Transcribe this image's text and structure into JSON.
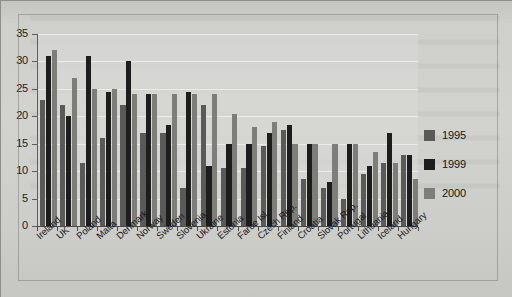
{
  "chart_data": {
    "type": "bar",
    "title": "",
    "xlabel": "",
    "ylabel": "",
    "ylim": [
      0,
      35
    ],
    "ytick_step": 5,
    "yticks": [
      0,
      5,
      10,
      15,
      20,
      25,
      30,
      35
    ],
    "grid": true,
    "legend_position": "right",
    "categories": [
      "Ireland",
      "UK",
      "Poland",
      "Malta",
      "Denmark",
      "Norway",
      "Sweden",
      "Slovenia",
      "Ukraine",
      "Estonia",
      "Faroe Isl.",
      "Czech Rep.",
      "Finland",
      "Croatia",
      "Slovak Rep.",
      "Portugal",
      "Lithuania",
      "Iceland",
      "Hungary"
    ],
    "series": [
      {
        "name": "1995",
        "color": "#5a5a58",
        "values": [
          23,
          22,
          11.5,
          16,
          22,
          17,
          17,
          7,
          22,
          10.5,
          10.5,
          14.5,
          17.5,
          8.5,
          7,
          5,
          9.5,
          11.5,
          13
        ]
      },
      {
        "name": "1999",
        "color": "#1d1d1d",
        "values": [
          31,
          20,
          31,
          24.5,
          30,
          24,
          18.5,
          24.5,
          11,
          15,
          15,
          17,
          18.5,
          15,
          8,
          15,
          11,
          17,
          13
        ]
      },
      {
        "name": "2000",
        "color": "#7d7d7a",
        "values": [
          32,
          27,
          25,
          25,
          24,
          24,
          24,
          24,
          24,
          20.5,
          18,
          19,
          15,
          15,
          15,
          15,
          13.5,
          11.5,
          8.5
        ]
      }
    ]
  },
  "legend": {
    "entries": [
      {
        "label": "1995",
        "color": "#5a5a58"
      },
      {
        "label": "1999",
        "color": "#1d1d1d"
      },
      {
        "label": "2000",
        "color": "#7d7d7a"
      }
    ]
  },
  "colors": {
    "series_1995": "#5a5a58",
    "series_1999": "#1d1d1d",
    "series_2000": "#7d7d7a",
    "plot_background": "#d7d7d4",
    "page_background": "#c8c8c5",
    "axis": "#4a4a48"
  }
}
